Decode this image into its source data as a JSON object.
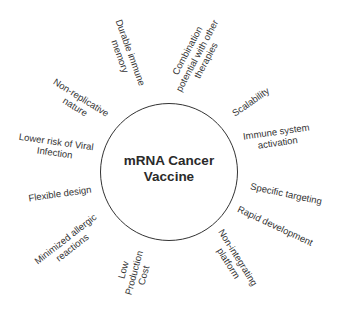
{
  "center": {
    "line1": "mRNA Cancer",
    "line2": "Vaccine"
  },
  "features": [
    {
      "lines": [
        "Durable immune",
        "memory"
      ]
    },
    {
      "lines": [
        "Combination",
        "potential with other",
        "therapies"
      ]
    },
    {
      "lines": [
        "Scalability"
      ]
    },
    {
      "lines": [
        "Immune system",
        "activation"
      ]
    },
    {
      "lines": [
        "Specific targeting"
      ]
    },
    {
      "lines": [
        "Rapid development"
      ]
    },
    {
      "lines": [
        "Non-integrating",
        "platform"
      ]
    },
    {
      "lines": [
        "Low",
        "Production",
        "Cost"
      ]
    },
    {
      "lines": [
        "Minimized allergic",
        "reactions"
      ]
    },
    {
      "lines": [
        "Flexible design"
      ]
    },
    {
      "lines": [
        "Lower risk of Viral",
        "Infection"
      ]
    },
    {
      "lines": [
        "Non-replicative",
        "nature"
      ]
    }
  ]
}
